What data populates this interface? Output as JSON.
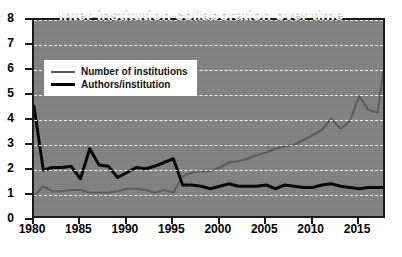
{
  "chart_data": {
    "type": "line",
    "title": "Inter-institution collaboration over time",
    "xlabel": "",
    "ylabel": "",
    "xlim": [
      1980,
      2018
    ],
    "ylim": [
      0,
      8
    ],
    "grid": true,
    "legend_position": "top-left",
    "yticks": [
      0,
      1,
      2,
      3,
      4,
      5,
      6,
      7,
      8
    ],
    "xticks": [
      1980,
      1985,
      1990,
      1995,
      2000,
      2005,
      2010,
      2015
    ],
    "x": [
      1980,
      1981,
      1982,
      1983,
      1984,
      1985,
      1986,
      1987,
      1988,
      1989,
      1990,
      1991,
      1992,
      1993,
      1994,
      1995,
      1996,
      1997,
      1998,
      1999,
      2000,
      2001,
      2002,
      2003,
      2004,
      2005,
      2006,
      2007,
      2008,
      2009,
      2010,
      2011,
      2012,
      2013,
      2014,
      2015,
      2016,
      2017,
      2018
    ],
    "series": [
      {
        "name": "Number of institutions",
        "color": "#5a5a5a",
        "values": [
          0.95,
          1.35,
          1.15,
          1.15,
          1.2,
          1.2,
          1.1,
          1.1,
          1.1,
          1.15,
          1.25,
          1.25,
          1.2,
          1.1,
          1.2,
          1.1,
          1.75,
          1.9,
          1.95,
          1.95,
          2.1,
          2.3,
          2.35,
          2.45,
          2.6,
          2.7,
          2.85,
          2.95,
          3.0,
          3.2,
          3.4,
          3.6,
          4.05,
          3.65,
          3.95,
          4.95,
          4.4,
          4.3,
          7.0
        ]
      },
      {
        "name": "Authors/institution",
        "color": "#000000",
        "values": [
          4.55,
          2.0,
          2.1,
          2.1,
          2.15,
          1.65,
          2.85,
          2.2,
          2.15,
          1.7,
          1.9,
          2.1,
          2.05,
          2.15,
          2.3,
          2.45,
          1.4,
          1.4,
          1.35,
          1.25,
          1.35,
          1.45,
          1.35,
          1.35,
          1.35,
          1.4,
          1.25,
          1.4,
          1.35,
          1.3,
          1.3,
          1.4,
          1.45,
          1.35,
          1.3,
          1.25,
          1.3,
          1.3,
          1.3
        ]
      }
    ]
  },
  "legend": {
    "items": [
      {
        "label": "Number of institutions",
        "style": "gray"
      },
      {
        "label": "Authors/institution",
        "style": "black"
      }
    ]
  }
}
